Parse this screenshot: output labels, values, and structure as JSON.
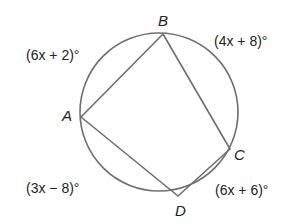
{
  "diagram": {
    "type": "inscribed quadrilateral in circle",
    "circle": {
      "cx": 159,
      "cy": 112,
      "r": 79
    },
    "points": [
      {
        "name": "A",
        "x": 81,
        "y": 117
      },
      {
        "name": "B",
        "x": 163,
        "y": 34
      },
      {
        "name": "C",
        "x": 230,
        "y": 149
      },
      {
        "name": "D",
        "x": 178,
        "y": 196
      }
    ],
    "segments": [
      "AB",
      "BC",
      "CD",
      "DA"
    ],
    "arc_labels": {
      "AB": "(6x + 2)°",
      "BC": "(4x + 8)°",
      "CD": "(6x + 6)°",
      "DA": "(3x − 8)°"
    },
    "colors": {
      "stroke": "#6e6e6e",
      "text": "#222222"
    }
  }
}
